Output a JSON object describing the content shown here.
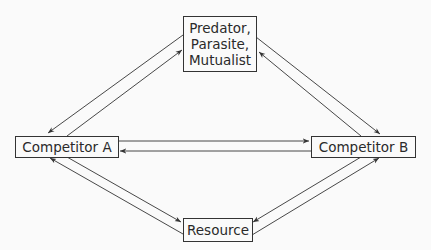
{
  "diagram": {
    "nodes": {
      "top": {
        "label": "Predator,\nParasite,\nMutualist"
      },
      "competitor_a": {
        "label": "Competitor A"
      },
      "competitor_b": {
        "label": "Competitor B"
      },
      "resource": {
        "label": "Resource"
      }
    },
    "edges": [
      {
        "from": "Predator, Parasite, Mutualist",
        "to": "Competitor A"
      },
      {
        "from": "Competitor A",
        "to": "Predator, Parasite, Mutualist"
      },
      {
        "from": "Predator, Parasite, Mutualist",
        "to": "Competitor B"
      },
      {
        "from": "Competitor B",
        "to": "Predator, Parasite, Mutualist"
      },
      {
        "from": "Competitor A",
        "to": "Competitor B"
      },
      {
        "from": "Competitor B",
        "to": "Competitor A"
      },
      {
        "from": "Competitor A",
        "to": "Resource"
      },
      {
        "from": "Resource",
        "to": "Competitor A"
      },
      {
        "from": "Competitor B",
        "to": "Resource"
      },
      {
        "from": "Resource",
        "to": "Competitor B"
      }
    ],
    "colors": {
      "line": "#333333",
      "background": "#fafafa"
    }
  }
}
